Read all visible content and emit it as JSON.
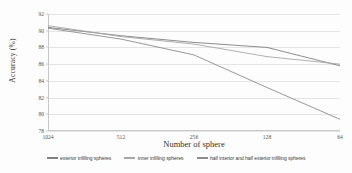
{
  "chart_data": {
    "type": "line",
    "title": "",
    "xlabel": "Number of sphere",
    "ylabel": "Accuracy (%)",
    "categories": [
      "1024",
      "512",
      "256",
      "128",
      "64"
    ],
    "x_tick_labels": [
      "1024",
      "512",
      "256",
      "128",
      "64"
    ],
    "y_tick_labels": [
      "78",
      "80",
      "82",
      "84",
      "86",
      "88",
      "90",
      "92"
    ],
    "y_ticks": [
      78,
      80,
      82,
      84,
      86,
      88,
      90,
      92
    ],
    "ylim": [
      78,
      92
    ],
    "grid": true,
    "legend_position": "bottom",
    "series": [
      {
        "name": "exterior infilling spheres",
        "color": "#808080",
        "values": [
          90.4,
          89.4,
          88.6,
          88.0,
          85.8
        ]
      },
      {
        "name": "inner infilling spheres",
        "color": "#a6a6a6",
        "values": [
          90.6,
          89.3,
          88.4,
          86.9,
          86.0
        ]
      },
      {
        "name": "half interior and half exterior infilling spheres",
        "color": "#8c8c8c",
        "values": [
          90.3,
          89.0,
          87.1,
          83.2,
          79.4
        ]
      }
    ]
  },
  "legend": {
    "items": [
      {
        "label": "exterior infilling spheres",
        "color": "#808080"
      },
      {
        "label": "inner infilling spheres",
        "color": "#a6a6a6"
      },
      {
        "label": "half interior and half exterior infilling spheres",
        "color": "#8c8c8c"
      }
    ]
  }
}
